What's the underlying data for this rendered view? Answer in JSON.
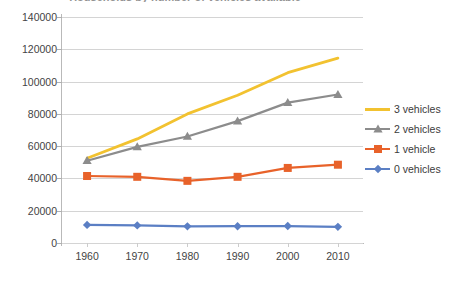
{
  "chart_data": {
    "type": "line",
    "title": "Households by number of vehicles available",
    "xlabel": "",
    "ylabel": "",
    "categories": [
      "1960",
      "1970",
      "1980",
      "1990",
      "2000",
      "2010"
    ],
    "x": [
      1960,
      1970,
      1980,
      1990,
      2000,
      2010
    ],
    "ylim": [
      0,
      140000
    ],
    "yticks": [
      0,
      20000,
      40000,
      60000,
      80000,
      100000,
      120000,
      140000
    ],
    "ytick_labels": [
      "0",
      "20000",
      "40000",
      "60000",
      "80000",
      "100000",
      "120000",
      "140000"
    ],
    "grid": true,
    "legend_position": "right",
    "series": [
      {
        "name": "3 vehicles",
        "color": "#f2c230",
        "marker": "none",
        "values": [
          52500,
          64500,
          80000,
          91500,
          105500,
          114500
        ]
      },
      {
        "name": "2 vehicles",
        "color": "#8c8c8c",
        "marker": "triangle",
        "values": [
          51000,
          59500,
          66000,
          75500,
          87000,
          92000
        ]
      },
      {
        "name": "1 vehicle",
        "color": "#e8622a",
        "marker": "square",
        "values": [
          41500,
          41000,
          38500,
          41000,
          46500,
          48500
        ]
      },
      {
        "name": "0 vehicles",
        "color": "#5b7fc4",
        "marker": "diamond",
        "values": [
          11200,
          10900,
          10300,
          10400,
          10500,
          10000
        ]
      }
    ]
  },
  "legend": {
    "items": [
      {
        "label": "3 vehicles",
        "color": "#f2c230",
        "marker": "none"
      },
      {
        "label": "2 vehicles",
        "color": "#8c8c8c",
        "marker": "triangle"
      },
      {
        "label": "1 vehicle",
        "color": "#e8622a",
        "marker": "square"
      },
      {
        "label": "0 vehicles",
        "color": "#5b7fc4",
        "marker": "diamond"
      }
    ]
  },
  "colors": {
    "gridline": "#d4d4d4",
    "axis": "#b9b9b9",
    "text": "#444444",
    "background": "#ffffff"
  }
}
